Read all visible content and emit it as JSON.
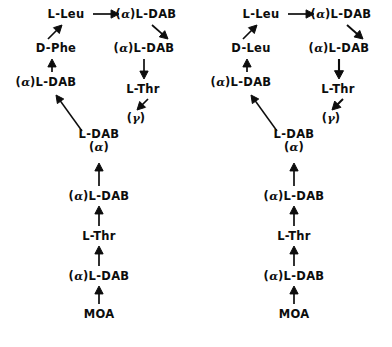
{
  "figure": {
    "title": "",
    "background_color": "#ffffff",
    "ink_color": "#0d0d0d",
    "width": 392,
    "height": 347
  },
  "chart_data": {
    "type": "diagram",
    "title": "",
    "subtitle": "",
    "xlabel": "",
    "ylabel": "",
    "structures": [
      {
        "name": "structure-left",
        "variable_residue": "D-Phe",
        "nodes": [
          {
            "id": "L1",
            "label": "L-Leu",
            "alpha": false,
            "gamma": false,
            "stacked": false,
            "x": 66,
            "y": 14
          },
          {
            "id": "L2",
            "label": "(α)L-DAB",
            "alpha": true,
            "gamma": false,
            "stacked": false,
            "x": 146,
            "y": 14
          },
          {
            "id": "L3",
            "label": "D-Phe",
            "alpha": false,
            "gamma": false,
            "stacked": false,
            "x": 56,
            "y": 48
          },
          {
            "id": "L4",
            "label": "(α)L-DAB",
            "alpha": true,
            "gamma": false,
            "stacked": false,
            "x": 144,
            "y": 48
          },
          {
            "id": "L5",
            "label": "(α)L-DAB",
            "alpha": true,
            "gamma": false,
            "stacked": false,
            "x": 46,
            "y": 82
          },
          {
            "id": "L6",
            "label": "L-Thr",
            "alpha": false,
            "gamma": false,
            "stacked": false,
            "x": 143,
            "y": 89
          },
          {
            "id": "L7",
            "label": "(γ)",
            "alpha": false,
            "gamma": true,
            "stacked": false,
            "x": 136,
            "y": 118
          },
          {
            "id": "L8",
            "label": "L-DAB",
            "alpha": false,
            "gamma": false,
            "stacked": true,
            "line2": "(α)",
            "x": 99,
            "y": 141
          },
          {
            "id": "L9",
            "label": "(α)L-DAB",
            "alpha": true,
            "gamma": false,
            "stacked": false,
            "x": 99,
            "y": 196
          },
          {
            "id": "L10",
            "label": "L-Thr",
            "alpha": false,
            "gamma": false,
            "stacked": false,
            "x": 99,
            "y": 236
          },
          {
            "id": "L11",
            "label": "(α)L-DAB",
            "alpha": true,
            "gamma": false,
            "stacked": false,
            "x": 99,
            "y": 276
          },
          {
            "id": "L12",
            "label": "MOA",
            "alpha": false,
            "gamma": false,
            "stacked": false,
            "x": 99,
            "y": 314
          }
        ],
        "arrows": [
          {
            "from": "L1",
            "to": "L2",
            "x1": 93,
            "y1": 14,
            "x2": 119,
            "y2": 14,
            "width": 1.7
          },
          {
            "from": "L2",
            "to": "L4",
            "x1": 152,
            "y1": 25,
            "x2": 168,
            "y2": 39,
            "width": 1.7
          },
          {
            "from": "L4",
            "to": "L6",
            "x1": 144,
            "y1": 59,
            "x2": 144,
            "y2": 79,
            "width": 1.7
          },
          {
            "from": "L6",
            "to": "L7",
            "x1": 148,
            "y1": 99,
            "x2": 137,
            "y2": 110,
            "width": 1.7
          },
          {
            "from": "L8",
            "to": "L5",
            "x1": 82,
            "y1": 131,
            "x2": 56,
            "y2": 95,
            "width": 1.5
          },
          {
            "from": "L5",
            "to": "L3",
            "x1": 52,
            "y1": 72,
            "x2": 52,
            "y2": 59,
            "width": 1.7
          },
          {
            "from": "L3",
            "to": "L1",
            "x1": 48,
            "y1": 39,
            "x2": 62,
            "y2": 25,
            "width": 1.7
          },
          {
            "from": "L9",
            "to": "L8",
            "x1": 99,
            "y1": 186,
            "x2": 99,
            "y2": 163,
            "width": 1.7
          },
          {
            "from": "L10",
            "to": "L9",
            "x1": 99,
            "y1": 226,
            "x2": 99,
            "y2": 206,
            "width": 1.7
          },
          {
            "from": "L11",
            "to": "L10",
            "x1": 99,
            "y1": 266,
            "x2": 99,
            "y2": 246,
            "width": 1.7
          },
          {
            "from": "L12",
            "to": "L11",
            "x1": 99,
            "y1": 304,
            "x2": 99,
            "y2": 286,
            "width": 1.7
          }
        ]
      },
      {
        "name": "structure-right",
        "variable_residue": "D-Leu",
        "nodes": [
          {
            "id": "R1",
            "label": "L-Leu",
            "alpha": false,
            "gamma": false,
            "stacked": false,
            "x": 261,
            "y": 14
          },
          {
            "id": "R2",
            "label": "(α)L-DAB",
            "alpha": true,
            "gamma": false,
            "stacked": false,
            "x": 341,
            "y": 14
          },
          {
            "id": "R3",
            "label": "D-Leu",
            "alpha": false,
            "gamma": false,
            "stacked": false,
            "x": 251,
            "y": 48
          },
          {
            "id": "R4",
            "label": "(α)L-DAB",
            "alpha": true,
            "gamma": false,
            "stacked": false,
            "x": 339,
            "y": 48
          },
          {
            "id": "R5",
            "label": "(α)L-DAB",
            "alpha": true,
            "gamma": false,
            "stacked": false,
            "x": 241,
            "y": 82
          },
          {
            "id": "R6",
            "label": "L-Thr",
            "alpha": false,
            "gamma": false,
            "stacked": false,
            "x": 338,
            "y": 89
          },
          {
            "id": "R7",
            "label": "(γ)",
            "alpha": false,
            "gamma": true,
            "stacked": false,
            "x": 331,
            "y": 118
          },
          {
            "id": "R8",
            "label": "L-DAB",
            "alpha": false,
            "gamma": false,
            "stacked": true,
            "line2": "(α)",
            "x": 294,
            "y": 141
          },
          {
            "id": "R9",
            "label": "(α)L-DAB",
            "alpha": true,
            "gamma": false,
            "stacked": false,
            "x": 294,
            "y": 196
          },
          {
            "id": "R10",
            "label": "L-Thr",
            "alpha": false,
            "gamma": false,
            "stacked": false,
            "x": 294,
            "y": 236
          },
          {
            "id": "R11",
            "label": "(α)L-DAB",
            "alpha": true,
            "gamma": false,
            "stacked": false,
            "x": 294,
            "y": 276
          },
          {
            "id": "R12",
            "label": "MOA",
            "alpha": false,
            "gamma": false,
            "stacked": false,
            "x": 294,
            "y": 314
          }
        ],
        "arrows": [
          {
            "from": "R1",
            "to": "R2",
            "x1": 288,
            "y1": 14,
            "x2": 314,
            "y2": 14,
            "width": 1.7
          },
          {
            "from": "R2",
            "to": "R4",
            "x1": 347,
            "y1": 25,
            "x2": 363,
            "y2": 39,
            "width": 1.9
          },
          {
            "from": "R4",
            "to": "R6",
            "x1": 339,
            "y1": 59,
            "x2": 339,
            "y2": 79,
            "width": 2.1
          },
          {
            "from": "R6",
            "to": "R7",
            "x1": 343,
            "y1": 99,
            "x2": 332,
            "y2": 110,
            "width": 2.0
          },
          {
            "from": "R8",
            "to": "R5",
            "x1": 277,
            "y1": 131,
            "x2": 251,
            "y2": 95,
            "width": 1.5
          },
          {
            "from": "R5",
            "to": "R3",
            "x1": 247,
            "y1": 72,
            "x2": 247,
            "y2": 59,
            "width": 1.7
          },
          {
            "from": "R3",
            "to": "R1",
            "x1": 243,
            "y1": 39,
            "x2": 257,
            "y2": 25,
            "width": 1.7
          },
          {
            "from": "R9",
            "to": "R8",
            "x1": 294,
            "y1": 186,
            "x2": 294,
            "y2": 163,
            "width": 1.7
          },
          {
            "from": "R10",
            "to": "R9",
            "x1": 294,
            "y1": 226,
            "x2": 294,
            "y2": 206,
            "width": 1.7
          },
          {
            "from": "R11",
            "to": "R10",
            "x1": 294,
            "y1": 266,
            "x2": 294,
            "y2": 246,
            "width": 1.7
          },
          {
            "from": "R12",
            "to": "R11",
            "x1": 294,
            "y1": 304,
            "x2": 294,
            "y2": 286,
            "width": 1.7
          }
        ]
      }
    ]
  }
}
